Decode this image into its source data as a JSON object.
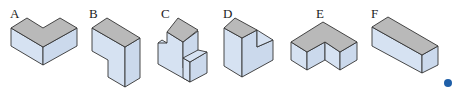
{
  "figure": {
    "labels": [
      "A",
      "B",
      "C",
      "D",
      "E",
      "F"
    ],
    "colors": {
      "top_face": "#b9b9b9",
      "side_face": "#d6e2f2",
      "edge": "#333333",
      "dot": "#1f5fa8"
    }
  }
}
